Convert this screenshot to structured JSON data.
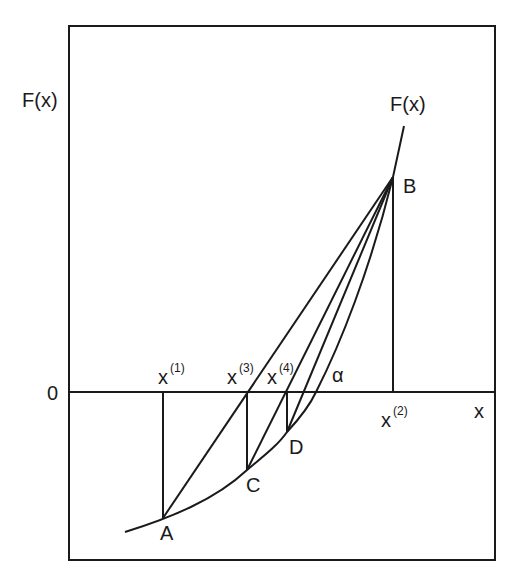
{
  "diagram": {
    "type": "regula-falsi / secant iteration diagram",
    "y_axis_label": "F(x)",
    "x_axis_label": "x",
    "origin_label": "0",
    "curve_label": "F(x)",
    "root_label": "α",
    "iterates": [
      {
        "base": "x",
        "sup": "(1)"
      },
      {
        "base": "x",
        "sup": "(2)"
      },
      {
        "base": "x",
        "sup": "(3)"
      },
      {
        "base": "x",
        "sup": "(4)"
      }
    ],
    "points": [
      "A",
      "B",
      "C",
      "D"
    ],
    "stroke_color": "#1a1a1a",
    "background": "#ffffff"
  }
}
